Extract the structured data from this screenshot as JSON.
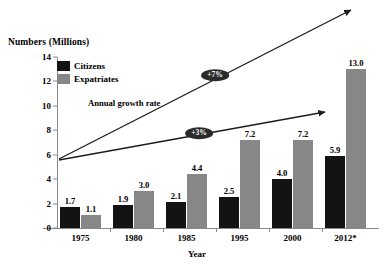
{
  "chart_data": {
    "type": "bar",
    "title": "",
    "ylabel": "Numbers (Millions)",
    "xlabel": "Year",
    "categories": [
      "1975",
      "1980",
      "1985",
      "1995",
      "2000",
      "2012*"
    ],
    "series": [
      {
        "name": "Citizens",
        "color": "#131313",
        "values": [
          1.7,
          1.9,
          2.1,
          2.5,
          4.0,
          5.9
        ]
      },
      {
        "name": "Expatriates",
        "color": "#878787",
        "values": [
          1.1,
          3.0,
          4.4,
          7.2,
          7.2,
          13.0
        ]
      }
    ],
    "ylim": [
      0,
      14
    ],
    "yticks": [
      0,
      2,
      4,
      6,
      8,
      10,
      12,
      14
    ],
    "grid": false,
    "legend_position": "top-left",
    "annotations": [
      {
        "name": "annual-growth-rate-caption",
        "text": "Annual growth rate"
      },
      {
        "name": "growth-badge-expatriates",
        "text": "+7%"
      },
      {
        "name": "growth-badge-citizens",
        "text": "+3%"
      }
    ]
  },
  "legend": {
    "items": [
      {
        "label": "Citizens",
        "color": "#131313"
      },
      {
        "label": "Expatriates",
        "color": "#878787"
      }
    ]
  },
  "axes": {
    "y_title": "Numbers (Millions)",
    "x_title": "Year",
    "y_ticks": [
      "14",
      "12",
      "10",
      "8",
      "6",
      "4",
      "2",
      "0"
    ],
    "x_ticks": [
      "1975",
      "1980",
      "1985",
      "1995",
      "2000",
      "2012*"
    ]
  },
  "labels": {
    "citizens": [
      "1.7",
      "1.9",
      "2.1",
      "2.5",
      "4.0",
      "5.9"
    ],
    "expatriates": [
      "1.1",
      "3.0",
      "4.4",
      "7.2",
      "7.2",
      "13.0"
    ]
  },
  "annotations": {
    "caption": "Annual growth rate",
    "badge_upper": "+7%",
    "badge_lower": "+3%"
  }
}
